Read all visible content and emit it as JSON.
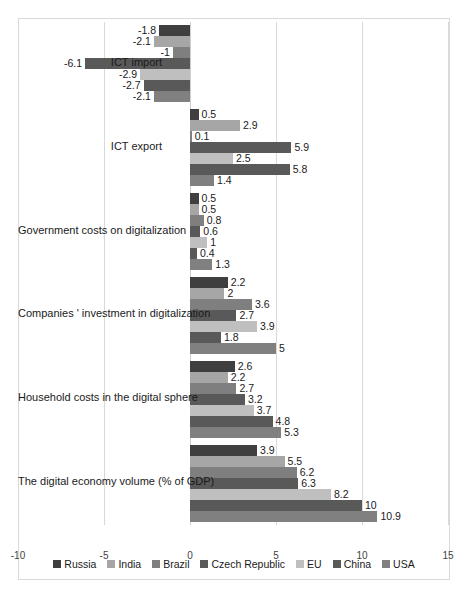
{
  "chart_data": {
    "type": "bar",
    "orientation": "horizontal",
    "title": "",
    "xlabel": "",
    "ylabel": "",
    "xlim": [
      -10,
      15
    ],
    "xticks": [
      "-10",
      "-5",
      "0",
      "5",
      "10",
      "15"
    ],
    "grid": true,
    "legend_position": "bottom",
    "categories": [
      "ICT import",
      "ICT export",
      "Government costs on digitalization",
      "Companies ' investment in digitalization",
      "Household costs in the digital sphere",
      "The digital economy volume (% of GDP)"
    ],
    "series": [
      {
        "name": "Russia",
        "color": "#3f3f3f",
        "values": [
          -1.8,
          0.5,
          0.5,
          2.2,
          2.6,
          3.9
        ]
      },
      {
        "name": "India",
        "color": "#a6a6a6",
        "values": [
          -2.1,
          2.9,
          0.5,
          2.0,
          2.2,
          5.5
        ]
      },
      {
        "name": "Brazil",
        "color": "#7f7f7f",
        "values": [
          -1.0,
          0.1,
          0.8,
          3.6,
          2.7,
          6.2
        ]
      },
      {
        "name": "Czech Republic",
        "color": "#595959",
        "values": [
          -6.1,
          5.9,
          0.6,
          2.7,
          3.2,
          6.3
        ]
      },
      {
        "name": "EU",
        "color": "#bfbfbf",
        "values": [
          -2.9,
          2.5,
          1.0,
          3.9,
          3.7,
          8.2
        ]
      },
      {
        "name": "China",
        "color": "#595959",
        "values": [
          -2.7,
          5.8,
          0.4,
          1.8,
          4.8,
          10.0
        ]
      },
      {
        "name": "USA",
        "color": "#808080",
        "values": [
          -2.1,
          1.4,
          1.3,
          5.0,
          5.3,
          10.9
        ]
      }
    ],
    "data_labels": [
      [
        "-1.8",
        "-2.1",
        "-1",
        "-6.1",
        "-2.9",
        "-2.7",
        "-2.1"
      ],
      [
        "0.5",
        "2.9",
        "0.1",
        "5.9",
        "2.5",
        "5.8",
        "1.4"
      ],
      [
        "0.5",
        "0.5",
        "0.8",
        "0.6",
        "1",
        "0.4",
        "1.3"
      ],
      [
        "2.2",
        "2",
        "3.6",
        "2.7",
        "3.9",
        "1.8",
        "5"
      ],
      [
        "2.6",
        "2.2",
        "2.7",
        "3.2",
        "3.7",
        "4.8",
        "5.3"
      ],
      [
        "3.9",
        "5.5",
        "6.2",
        "6.3",
        "8.2",
        "10",
        "10.9"
      ]
    ]
  },
  "legend": {
    "items": [
      {
        "label": "Russia"
      },
      {
        "label": "India"
      },
      {
        "label": "Brazil"
      },
      {
        "label": "Czech Republic"
      },
      {
        "label": "EU"
      },
      {
        "label": "China"
      },
      {
        "label": "USA"
      }
    ]
  }
}
